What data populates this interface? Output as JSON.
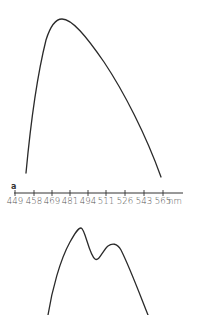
{
  "chart_data": [
    {
      "panel": "a",
      "type": "line",
      "title": "",
      "xlabel": "nm",
      "ylabel": "",
      "x_tick_labels": [
        "449",
        "458",
        "469",
        "481",
        "494",
        "511",
        "526",
        "543",
        "565"
      ],
      "x_unit": "nm",
      "grid": false,
      "legend": null,
      "description": "Single broad asymmetric emission/absorption band, rising steeply from ~455 nm to a peak near ~475 nm, then declining gradually to ~563 nm",
      "series": [
        {
          "name": "curve-a",
          "x": [
            455,
            460,
            465,
            470,
            475,
            481,
            494,
            511,
            526,
            543,
            563
          ],
          "y": [
            0.0,
            0.45,
            0.8,
            0.97,
            1.0,
            0.98,
            0.88,
            0.7,
            0.5,
            0.27,
            0.0
          ]
        }
      ]
    },
    {
      "panel": "b",
      "type": "line",
      "title": "",
      "xlabel": "",
      "ylabel": "",
      "grid": false,
      "legend": null,
      "description": "Double-peaked band shown below panel a (axis not visible, cropped)",
      "series": [
        {
          "name": "curve-b",
          "points_relative": [
            {
              "x": 0.0,
              "y": 0.0
            },
            {
              "x": 0.2,
              "y": 0.62
            },
            {
              "x": 0.32,
              "y": 1.0
            },
            {
              "x": 0.5,
              "y": 0.64
            },
            {
              "x": 0.66,
              "y": 0.81
            },
            {
              "x": 1.0,
              "y": 0.0
            }
          ]
        }
      ]
    }
  ],
  "axis": {
    "panel_label": "a",
    "unit": "nm",
    "ticks": [
      {
        "label": "449",
        "x": 15
      },
      {
        "label": "458",
        "x": 34
      },
      {
        "label": "469",
        "x": 52
      },
      {
        "label": "481",
        "x": 70
      },
      {
        "label": "494",
        "x": 88
      },
      {
        "label": "511",
        "x": 106
      },
      {
        "label": "526",
        "x": 125
      },
      {
        "label": "543",
        "x": 144
      },
      {
        "label": "565",
        "x": 163
      }
    ]
  }
}
